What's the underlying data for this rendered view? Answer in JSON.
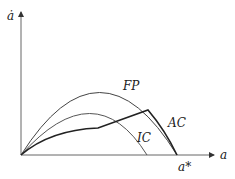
{
  "diagram": {
    "y_axis_label": "ȧ",
    "x_axis_label": "a",
    "x_marker_label": "a*",
    "curves": [
      {
        "name": "FP",
        "label": "FP"
      },
      {
        "name": "AC",
        "label": "AC"
      },
      {
        "name": "IC",
        "label": "IC"
      }
    ]
  }
}
